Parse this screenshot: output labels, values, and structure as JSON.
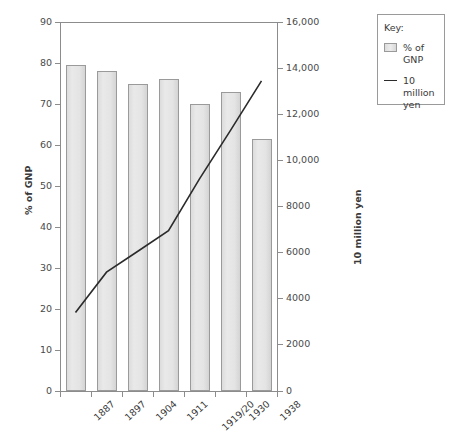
{
  "chart_data": {
    "type": "bar",
    "title": "",
    "subtitle": "",
    "categories": [
      "1887",
      "1897",
      "1904",
      "1911",
      "1919/20",
      "1930",
      "1938"
    ],
    "xlabel": "",
    "grid": false,
    "legend_position": "right-outside",
    "series": [
      {
        "name": "% of GNP",
        "type": "bar",
        "axis": "left",
        "values": [
          79.5,
          78,
          75,
          76,
          70,
          73,
          61.5
        ]
      },
      {
        "name": "10 million yen",
        "type": "line",
        "axis": "right",
        "values": [
          3400,
          5150,
          6050,
          6950,
          9200,
          11300,
          13450
        ]
      }
    ],
    "axes": {
      "left": {
        "label": "% of GNP",
        "ylim": [
          0,
          90
        ],
        "tick_step": 10,
        "ticks": [
          "0",
          "10",
          "20",
          "30",
          "40",
          "50",
          "60",
          "70",
          "80",
          "90"
        ]
      },
      "right": {
        "label": "10 million yen",
        "ylim": [
          0,
          16000
        ],
        "tick_step": 2000,
        "ticks": [
          "0",
          "2000",
          "4000",
          "6000",
          "8000",
          "10,000",
          "12,000",
          "14,000",
          "16,000"
        ]
      }
    }
  },
  "legend": {
    "title": "Key:",
    "entries": [
      {
        "label": "% of GNP",
        "swatch": "bar-swatch",
        "color": "#e4e4e4"
      },
      {
        "label": "10 million\nyen",
        "label_line1": "10 million",
        "label_line2": "yen",
        "swatch": "line-swatch",
        "color": "#2b2b2b"
      }
    ]
  },
  "colors": {
    "bar_fill": "#e4e4e4",
    "bar_stroke": "#9a9a9a",
    "line": "#2b2b2b",
    "axis": "#8c8c8c",
    "text": "#3a3a3a"
  }
}
